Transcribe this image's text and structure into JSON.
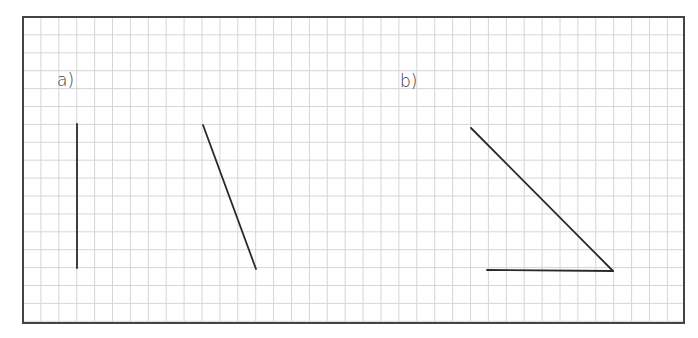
{
  "worksheet": {
    "grid": {
      "left": 23,
      "top": 17,
      "right": 684,
      "bottom": 323,
      "cell_size": 17.9,
      "grid_color": "#d6d6d6",
      "border_color": "#444444",
      "line_color": "#2a2a2a"
    },
    "parts": [
      {
        "label": "a)",
        "label_x": 57,
        "label_y": 72,
        "segments": [
          {
            "x1": 77,
            "y1": 124,
            "x2": 77,
            "y2": 268
          },
          {
            "x1": 203,
            "y1": 125,
            "x2": 256,
            "y2": 269
          }
        ]
      },
      {
        "label": "b)",
        "label_x": 400,
        "label_y": 73,
        "segments": [
          {
            "x1": 471,
            "y1": 128,
            "x2": 613,
            "y2": 271
          },
          {
            "x1": 487,
            "y1": 270,
            "x2": 613,
            "y2": 271
          }
        ]
      }
    ]
  }
}
